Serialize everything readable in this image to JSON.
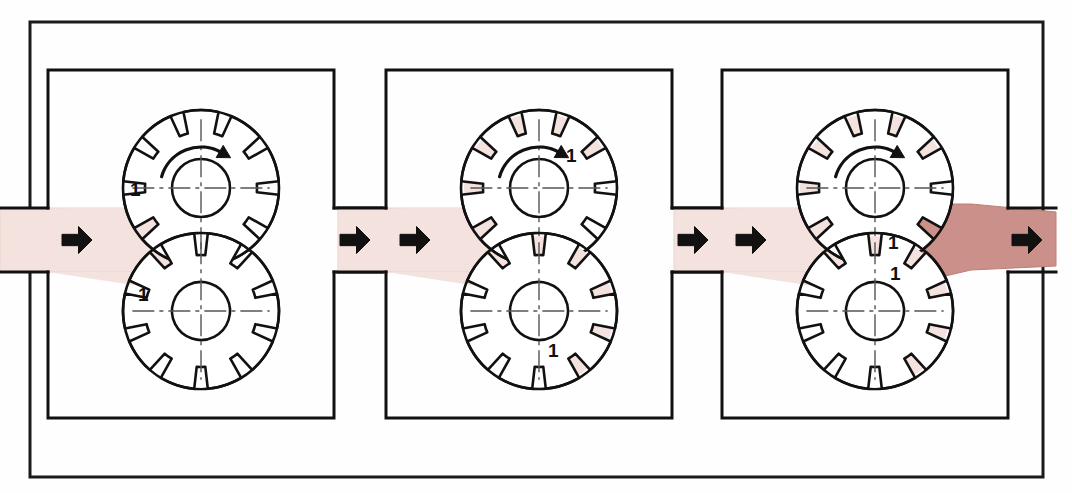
{
  "figure": {
    "frame": {
      "name": "outer-border",
      "x": 30,
      "y": 22,
      "w": 1013,
      "h": 455,
      "stroke": "#1a1a1a",
      "stroke_width": 3
    },
    "colors": {
      "line": "#111111",
      "fill_white": "#ffffff",
      "fluid_inlet": "#f4e2df",
      "fluid_inlet_edge": "#e9d2ce",
      "fluid_outlet": "#cb9089",
      "fluid_outlet_edge": "#bd7f77",
      "arrow_black": "#111111",
      "centerline": "#555555",
      "page_bg": "#fefefe"
    },
    "geometry": {
      "housing": {
        "w": 286,
        "h": 348,
        "y": 70,
        "port_top": 208,
        "port_bottom": 272,
        "port_depth": 48,
        "stroke_width": 3
      },
      "gear": {
        "outer_r": 78,
        "root_r": 56,
        "hub_r": 29,
        "teeth": 10,
        "tooth_half_angle_deg": 13
      },
      "upper_gear_cy": 188,
      "lower_gear_cy": 311,
      "gear_cx_offset": 153,
      "flow_arrow": {
        "w": 30,
        "h": 27
      }
    }
  },
  "panels": [
    {
      "id": "panel-1",
      "name": "stage-1-inlet-fill",
      "caption": "Stage 1 — fluid enters the inlet port",
      "x": 48,
      "inlet_filled": true,
      "outlet_filled": false,
      "gear_pockets_filled": false,
      "outlet_pressurized": false,
      "rotation_arrow": true,
      "rotation_direction": "clockwise",
      "labels": [
        {
          "text": "1",
          "name": "callout-upper-gear",
          "x": 130,
          "y": 196
        },
        {
          "text": "1",
          "name": "callout-lower-gear",
          "x": 138,
          "y": 301
        }
      ]
    },
    {
      "id": "panel-2",
      "name": "stage-2-pockets-carry",
      "caption": "Stage 2 — fluid is carried in the tooth pockets around the housing",
      "x": 386,
      "inlet_filled": true,
      "outlet_filled": false,
      "gear_pockets_filled": true,
      "outlet_pressurized": false,
      "rotation_arrow": true,
      "rotation_direction": "clockwise",
      "labels": [
        {
          "text": "1",
          "name": "callout-upper-gear",
          "x": 566,
          "y": 162
        },
        {
          "text": "1",
          "name": "callout-lower-gear",
          "x": 548,
          "y": 357
        }
      ]
    },
    {
      "id": "panel-3",
      "name": "stage-3-discharge",
      "caption": "Stage 3 — meshing teeth force fluid out of the discharge port",
      "x": 722,
      "inlet_filled": true,
      "outlet_filled": true,
      "gear_pockets_filled": true,
      "outlet_pressurized": true,
      "rotation_arrow": true,
      "rotation_direction": "clockwise",
      "labels": [
        {
          "text": "1",
          "name": "callout-upper-gear",
          "x": 888,
          "y": 249
        },
        {
          "text": "1",
          "name": "callout-lower-gear",
          "x": 890,
          "y": 280
        }
      ]
    }
  ],
  "flow_arrows": [
    {
      "name": "inlet-arrow-panel-1",
      "x": 62,
      "y": 240,
      "direction": "right",
      "tone": "black"
    },
    {
      "name": "outlet-arrow-panel-1",
      "x": 340,
      "y": 240,
      "direction": "right",
      "tone": "black"
    },
    {
      "name": "inlet-arrow-panel-2",
      "x": 400,
      "y": 240,
      "direction": "right",
      "tone": "black"
    },
    {
      "name": "outlet-arrow-panel-2",
      "x": 678,
      "y": 240,
      "direction": "right",
      "tone": "black"
    },
    {
      "name": "inlet-arrow-panel-3",
      "x": 736,
      "y": 240,
      "direction": "right",
      "tone": "black"
    },
    {
      "name": "outlet-arrow-panel-3",
      "x": 1012,
      "y": 240,
      "direction": "right",
      "tone": "black"
    }
  ]
}
